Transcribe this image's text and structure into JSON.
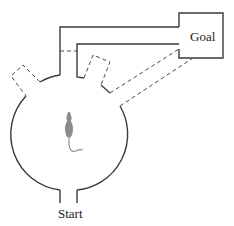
{
  "diagram": {
    "labels": {
      "goal": "Goal",
      "start": "Start"
    },
    "elements": {
      "arena": "circular-arena",
      "subject": "rat",
      "paths": [
        "blocked-corridor-to-goal",
        "left-dashed-arm",
        "right-dashed-arm",
        "dashed-diagonal-paths-to-goal"
      ]
    },
    "colors": {
      "wall": "#3a3a3a",
      "dashed": "#4a4a4a",
      "rat": "#8c8c8c",
      "background": "#ffffff"
    }
  }
}
